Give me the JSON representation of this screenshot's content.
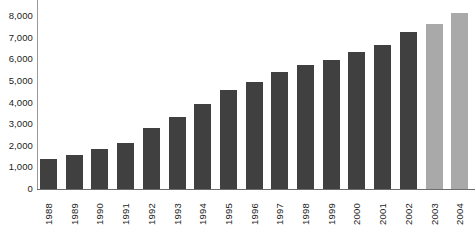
{
  "chart_data": {
    "type": "bar",
    "title": "",
    "subtitle": "",
    "xlabel": "",
    "ylabel": "",
    "grid": false,
    "legend": "none",
    "ylim": [
      0,
      9000
    ],
    "ytick_labels": [
      "9,000",
      "8,000",
      "7,000",
      "6,000",
      "5,000",
      "4,000",
      "3,000",
      "2,000",
      "1,000",
      "0"
    ],
    "ytick_values": [
      9000,
      8000,
      7000,
      6000,
      5000,
      4000,
      3000,
      2000,
      1000,
      0
    ],
    "categories": [
      "1988",
      "1989",
      "1990",
      "1991",
      "1992",
      "1993",
      "1994",
      "1995",
      "1996",
      "1997",
      "1998",
      "1999",
      "2000",
      "2001",
      "2002",
      "2003",
      "2004"
    ],
    "values": [
      1400,
      1550,
      1850,
      2150,
      2800,
      3350,
      3950,
      4600,
      4950,
      5400,
      5750,
      5950,
      6350,
      6650,
      7250,
      7650,
      8150
    ],
    "bar_colors": [
      "#404040",
      "#404040",
      "#404040",
      "#404040",
      "#404040",
      "#404040",
      "#404040",
      "#404040",
      "#404040",
      "#404040",
      "#404040",
      "#404040",
      "#404040",
      "#404040",
      "#404040",
      "#a9a9a9",
      "#a9a9a9"
    ],
    "colors": {
      "actual": "#404040",
      "projected": "#a9a9a9",
      "axis": "#6d6d6d",
      "text": "#1c1c1c",
      "background": "#ffffff"
    }
  }
}
